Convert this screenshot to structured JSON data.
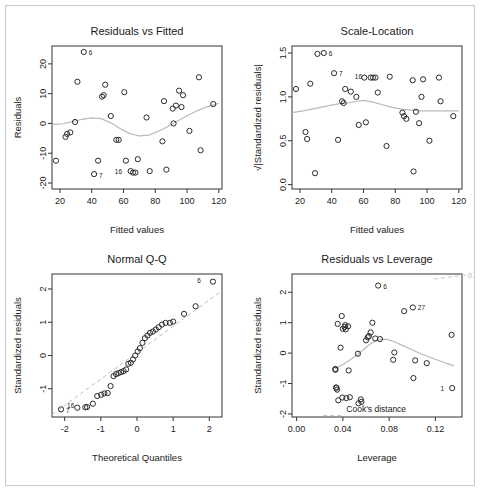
{
  "figure": {
    "background": "#ffffff",
    "border_color": "#c9c9c9",
    "point_color": "#2b2b2b",
    "smoother_color": "#b9b9b9"
  },
  "chart_data": [
    {
      "type": "scatter",
      "panel": "top-left",
      "title": "Residuals vs Fitted",
      "xlabel": "Fitted values",
      "ylabel": "Residuals",
      "xlim": [
        15,
        122
      ],
      "ylim": [
        -22,
        26
      ],
      "xticks": [
        20,
        40,
        60,
        80,
        100,
        120
      ],
      "xtick_labels": [
        "20",
        "40",
        "60",
        "80",
        "100",
        "120"
      ],
      "yticks": [
        -20,
        -10,
        0,
        10,
        20
      ],
      "ytick_labels": [
        "-20",
        "-10",
        "0",
        "10",
        "20"
      ],
      "grid": false,
      "legend": "none",
      "x": [
        17.5,
        23.5,
        24.5,
        26.5,
        29.5,
        31.0,
        35.0,
        41.5,
        44.0,
        46.5,
        47.5,
        48.5,
        52.0,
        55.5,
        57.0,
        60.5,
        61.5,
        64.5,
        66.0,
        67.5,
        69.0,
        74.5,
        76.5,
        84.5,
        85.5,
        87.0,
        91.0,
        91.5,
        93.0,
        95.0,
        96.5,
        97.5,
        101.5,
        107.5,
        108.5,
        116.5
      ],
      "y": [
        -12.5,
        -4.5,
        -3.5,
        -3.0,
        0.5,
        14.0,
        24.0,
        -17.0,
        -12.5,
        9.0,
        9.5,
        13.0,
        2.5,
        -5.5,
        -5.5,
        10.5,
        -12.5,
        -16.0,
        -16.5,
        -16.5,
        -12.0,
        2.0,
        -16.0,
        -6.0,
        7.5,
        -15.5,
        5.0,
        0.0,
        6.0,
        11.0,
        5.5,
        9.5,
        -2.5,
        15.5,
        -9.0,
        6.5
      ],
      "point_labels": [
        {
          "id": "6",
          "x": 35.0,
          "y": 24.0,
          "dx": 5,
          "dy": 3
        },
        {
          "id": "7",
          "x": 41.5,
          "y": -17.0,
          "dx": 5,
          "dy": 4
        },
        {
          "id": "16",
          "x": 66.0,
          "y": -16.5,
          "dx": -11,
          "dy": 1
        }
      ],
      "smoother": [
        [
          15,
          -0.3
        ],
        [
          22,
          -0.1
        ],
        [
          28,
          0.6
        ],
        [
          34,
          1.4
        ],
        [
          40,
          1.9
        ],
        [
          46,
          1.6
        ],
        [
          52,
          0.2
        ],
        [
          58,
          -1.8
        ],
        [
          64,
          -3.4
        ],
        [
          70,
          -4.2
        ],
        [
          76,
          -3.9
        ],
        [
          82,
          -2.6
        ],
        [
          88,
          -1.0
        ],
        [
          94,
          0.8
        ],
        [
          100,
          2.6
        ],
        [
          106,
          4.2
        ],
        [
          112,
          5.5
        ],
        [
          120,
          6.8
        ]
      ]
    },
    {
      "type": "scatter",
      "panel": "top-right",
      "title": "Scale-Location",
      "xlabel": "Fitted values",
      "ylabel": "Standardized residuals",
      "ylabel_prefix": "sqrt",
      "xlim": [
        15,
        122
      ],
      "ylim": [
        -0.05,
        1.58
      ],
      "xticks": [
        20,
        40,
        60,
        80,
        100,
        120
      ],
      "xtick_labels": [
        "20",
        "40",
        "60",
        "80",
        "100",
        "120"
      ],
      "yticks": [
        0.0,
        0.5,
        1.0,
        1.5
      ],
      "ytick_labels": [
        "0.0",
        "0.5",
        "1.0",
        "1.5"
      ],
      "grid": false,
      "legend": "none",
      "x": [
        17.5,
        23.5,
        24.5,
        26.5,
        29.5,
        31.0,
        35.0,
        41.5,
        44.0,
        46.5,
        47.5,
        48.5,
        52.0,
        55.5,
        57.0,
        60.5,
        61.5,
        64.5,
        66.0,
        67.5,
        69.0,
        74.5,
        76.5,
        84.5,
        85.5,
        87.0,
        91.0,
        91.5,
        93.0,
        95.0,
        96.5,
        97.5,
        101.5,
        107.5,
        108.5,
        116.5
      ],
      "y": [
        1.09,
        0.6,
        0.52,
        1.15,
        0.13,
        1.49,
        1.5,
        1.27,
        0.51,
        0.95,
        0.93,
        1.09,
        1.06,
        1.0,
        0.68,
        1.22,
        0.71,
        1.22,
        1.22,
        1.22,
        1.05,
        0.44,
        1.23,
        0.82,
        0.78,
        0.75,
        1.19,
        0.15,
        0.83,
        0.7,
        1.0,
        1.2,
        0.5,
        1.22,
        0.95,
        0.78
      ],
      "point_labels": [
        {
          "id": "6",
          "x": 35.0,
          "y": 1.5,
          "dx": 5,
          "dy": 3
        },
        {
          "id": "7",
          "x": 41.5,
          "y": 1.27,
          "dx": 5,
          "dy": 3
        },
        {
          "id": "16",
          "x": 66.0,
          "y": 1.22,
          "dx": -11,
          "dy": 1
        }
      ],
      "smoother": [
        [
          15,
          0.82
        ],
        [
          22,
          0.84
        ],
        [
          30,
          0.87
        ],
        [
          38,
          0.9
        ],
        [
          44,
          0.92
        ],
        [
          50,
          0.93
        ],
        [
          56,
          0.95
        ],
        [
          60,
          0.96
        ],
        [
          66,
          0.94
        ],
        [
          72,
          0.91
        ],
        [
          78,
          0.88
        ],
        [
          84,
          0.86
        ],
        [
          90,
          0.85
        ],
        [
          96,
          0.84
        ],
        [
          104,
          0.84
        ],
        [
          112,
          0.84
        ],
        [
          120,
          0.84
        ]
      ]
    },
    {
      "type": "scatter",
      "panel": "bottom-left",
      "title": "Normal Q-Q",
      "xlabel": "Theoretical Quantiles",
      "ylabel": "Standardized residuals",
      "xlim": [
        -2.35,
        2.35
      ],
      "ylim": [
        -1.85,
        2.45
      ],
      "xticks": [
        -2,
        -1,
        0,
        1,
        2
      ],
      "xtick_labels": [
        "-2",
        "-1",
        "0",
        "1",
        "2"
      ],
      "yticks": [
        -1,
        0,
        1,
        2
      ],
      "ytick_labels": [
        "-1",
        "0",
        "1",
        "2"
      ],
      "grid": false,
      "legend": "none",
      "x": [
        -2.1,
        -1.65,
        -1.43,
        -1.38,
        -1.22,
        -1.1,
        -0.99,
        -0.9,
        -0.81,
        -0.73,
        -0.65,
        -0.58,
        -0.51,
        -0.44,
        -0.37,
        -0.3,
        -0.24,
        -0.17,
        -0.11,
        -0.05,
        0.02,
        0.08,
        0.15,
        0.22,
        0.29,
        0.36,
        0.44,
        0.52,
        0.6,
        0.69,
        0.79,
        0.91,
        1.0,
        1.3,
        1.62,
        2.1
      ],
      "y": [
        -1.62,
        -1.57,
        -1.56,
        -1.55,
        -1.45,
        -1.22,
        -1.18,
        -1.14,
        -1.13,
        -0.92,
        -0.62,
        -0.56,
        -0.53,
        -0.5,
        -0.47,
        -0.42,
        -0.25,
        -0.22,
        -0.12,
        0.0,
        0.12,
        0.22,
        0.38,
        0.52,
        0.6,
        0.68,
        0.72,
        0.78,
        0.85,
        0.93,
        0.98,
        0.98,
        1.02,
        1.25,
        1.48,
        2.22
      ],
      "point_labels": [
        {
          "id": "6",
          "x": 2.1,
          "y": 2.22,
          "dx": -12,
          "dy": 1
        },
        {
          "id": "7",
          "x": -2.1,
          "y": -1.62,
          "dx": 5,
          "dy": 4
        },
        {
          "id": "16",
          "x": -1.43,
          "y": -1.56,
          "dx": -11,
          "dy": 1
        }
      ],
      "reference_line": [
        [
          -2.35,
          -1.78
        ],
        [
          2.35,
          1.95
        ]
      ]
    },
    {
      "type": "scatter",
      "panel": "bottom-right",
      "title": "Residuals vs Leverage",
      "xlabel": "Leverage",
      "ylabel": "Standardized residuals",
      "xlim": [
        -0.004,
        0.143
      ],
      "ylim": [
        -2.1,
        2.6
      ],
      "xticks": [
        0.0,
        0.04,
        0.08,
        0.12
      ],
      "xtick_labels": [
        "0.00",
        "0.04",
        "0.08",
        "0.12"
      ],
      "yticks": [
        -2,
        -1,
        0,
        1,
        2
      ],
      "ytick_labels": [
        "-2",
        "-1",
        "0",
        "1",
        "2"
      ],
      "grid": false,
      "legend_label": "Cook's distance",
      "cook_contour_label": "0.5",
      "x": [
        0.0335,
        0.0335,
        0.034,
        0.0345,
        0.035,
        0.0355,
        0.036,
        0.038,
        0.039,
        0.0395,
        0.04,
        0.0415,
        0.042,
        0.0425,
        0.043,
        0.0445,
        0.045,
        0.046,
        0.053,
        0.0535,
        0.0555,
        0.056,
        0.06,
        0.0615,
        0.0625,
        0.064,
        0.0655,
        0.068,
        0.0705,
        0.072,
        0.0835,
        0.0845,
        0.093,
        0.1005,
        0.101,
        0.1025,
        0.1125,
        0.134,
        0.1345
      ],
      "y": [
        -0.52,
        -0.55,
        -1.13,
        -1.14,
        -1.2,
        0.96,
        -1.55,
        0.18,
        1.22,
        -1.46,
        0.8,
        0.86,
        0.92,
        0.78,
        -1.48,
        0.88,
        -0.57,
        -1.45,
        -0.02,
        -1.65,
        -1.52,
        -1.6,
        0.42,
        0.52,
        0.56,
        0.68,
        1.0,
        0.48,
        2.22,
        0.46,
        -0.22,
        0.02,
        1.38,
        1.5,
        -0.82,
        -0.24,
        -0.33,
        0.6,
        -1.15
      ],
      "point_labels": [
        {
          "id": "6",
          "x": 0.0705,
          "y": 2.22,
          "dx": 5,
          "dy": 3
        },
        {
          "id": "27",
          "x": 0.1005,
          "y": 1.5,
          "dx": 5,
          "dy": 3
        },
        {
          "id": "1",
          "x": 0.1345,
          "y": -1.15,
          "dx": -8,
          "dy": 3
        }
      ],
      "smoother": [
        [
          0.033,
          -0.52
        ],
        [
          0.038,
          -0.42
        ],
        [
          0.043,
          -0.3
        ],
        [
          0.048,
          -0.18
        ],
        [
          0.053,
          -0.04
        ],
        [
          0.058,
          0.12
        ],
        [
          0.063,
          0.28
        ],
        [
          0.068,
          0.4
        ],
        [
          0.073,
          0.46
        ],
        [
          0.078,
          0.45
        ],
        [
          0.084,
          0.38
        ],
        [
          0.09,
          0.28
        ],
        [
          0.097,
          0.16
        ],
        [
          0.105,
          0.02
        ],
        [
          0.114,
          -0.12
        ],
        [
          0.124,
          -0.26
        ],
        [
          0.136,
          -0.42
        ]
      ],
      "cook_contours": [
        [
          [
            0.023,
            -2.05
          ],
          [
            0.04,
            -2.05
          ]
        ]
      ]
    }
  ]
}
